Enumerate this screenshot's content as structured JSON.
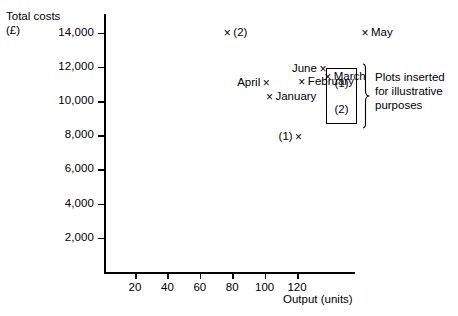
{
  "chart_data": {
    "type": "scatter",
    "title": "",
    "xlabel": "Output (units)",
    "ylabel": "Total costs\n(£)",
    "xlim": [
      0,
      140
    ],
    "ylim": [
      0,
      14000
    ],
    "grid": false,
    "legend": "none",
    "xticks": [
      20,
      40,
      60,
      80,
      100,
      120
    ],
    "xtick_labels": [
      "20",
      "40",
      "60",
      "80",
      "100",
      "120"
    ],
    "yticks": [
      2000,
      4000,
      6000,
      8000,
      10000,
      12000,
      14000
    ],
    "ytick_labels": [
      "2,000",
      "4,000",
      "6,000",
      "8,000",
      "10,000",
      "12,000",
      "14,000"
    ],
    "points": [
      {
        "label": "(2)",
        "x": 77,
        "y": 13950,
        "label_pos": "right",
        "marker": "×"
      },
      {
        "label": "May",
        "x": 162,
        "y": 13950,
        "label_pos": "right",
        "marker": "×"
      },
      {
        "label": "June",
        "x": 136,
        "y": 11850,
        "label_pos": "left",
        "marker": "×"
      },
      {
        "label": "March",
        "x": 139,
        "y": 11400,
        "label_pos": "right",
        "marker": "×"
      },
      {
        "label": "February",
        "x": 123,
        "y": 11100,
        "label_pos": "right",
        "marker": "×"
      },
      {
        "label": "April",
        "x": 101,
        "y": 11050,
        "label_pos": "left",
        "marker": "×"
      },
      {
        "label": "January",
        "x": 103,
        "y": 10250,
        "label_pos": "right",
        "marker": "×"
      },
      {
        "label": "(1)",
        "x": 121,
        "y": 7900,
        "label_pos": "left",
        "marker": "×"
      }
    ],
    "annotations": {
      "inset_items": [
        "(1)",
        "(2)"
      ],
      "note": "Plots inserted\nfor illustrative\npurposes"
    }
  }
}
